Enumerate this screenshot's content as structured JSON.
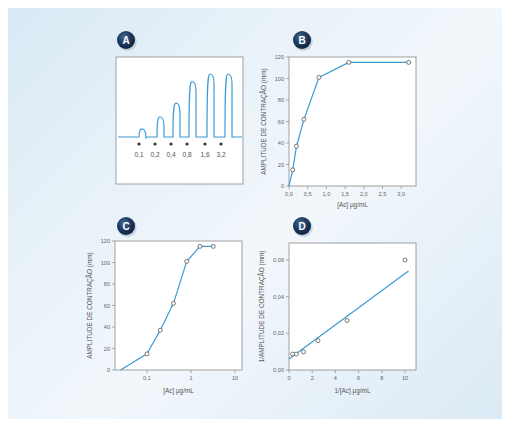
{
  "colors": {
    "line": "#3d9ad6",
    "frame": "#8a8a8a",
    "badge": "#1e3a60",
    "background": "#e3eff7"
  },
  "panels": {
    "A": {
      "badge": "A",
      "doses": [
        "0,1",
        "0,2",
        "0,4",
        "0,8",
        "1,6",
        "3,2"
      ]
    },
    "B": {
      "badge": "B",
      "xlabel": "[Ac] µg/mL",
      "ylabel": "AMPLITUDE DE CONTRAÇÃO (mm)",
      "xticks": [
        "0,0",
        "0,5",
        "1,0",
        "1,5",
        "2,0",
        "2,5",
        "3,0"
      ],
      "yticks": [
        "0",
        "20",
        "40",
        "60",
        "80",
        "100",
        "120"
      ]
    },
    "C": {
      "badge": "C",
      "xlabel": "[Ac] µg/mL",
      "ylabel": "AMPLITUDE DE CONTRAÇÃO (mm)",
      "xticks": [
        "0,1",
        "1",
        "10"
      ],
      "yticks": [
        "0",
        "20",
        "40",
        "60",
        "80",
        "100",
        "120"
      ]
    },
    "D": {
      "badge": "D",
      "xlabel": "1/[Ac] µg/mL",
      "ylabel": "1/AMPLITUDE DE CONTRAÇÃO (mm)",
      "xticks": [
        "0",
        "2",
        "4",
        "6",
        "8",
        "10"
      ],
      "yticks": [
        "0,00",
        "0,02",
        "0,04",
        "0,06"
      ]
    }
  },
  "chart_data": [
    {
      "panel": "A",
      "type": "line",
      "title": "Contraction trace",
      "categories": [
        "0,1",
        "0,2",
        "0,4",
        "0,8",
        "1,6",
        "3,2"
      ],
      "values": [
        15,
        37,
        62,
        101,
        115,
        115
      ],
      "xlabel": "",
      "ylabel": ""
    },
    {
      "panel": "B",
      "type": "line",
      "x": [
        0,
        0.1,
        0.2,
        0.4,
        0.8,
        1.6,
        3.2
      ],
      "values": [
        0,
        15,
        37,
        62,
        101,
        115,
        115
      ],
      "xlabel": "[Ac] µg/mL",
      "ylabel": "AMPLITUDE DE CONTRAÇÃO (mm)",
      "xlim": [
        0,
        3.4
      ],
      "ylim": [
        0,
        120
      ],
      "grid": false
    },
    {
      "panel": "C",
      "type": "line",
      "xscale": "log",
      "x": [
        0.025,
        0.1,
        0.2,
        0.4,
        0.8,
        1.6,
        3.2
      ],
      "values": [
        0,
        15,
        37,
        62,
        101,
        115,
        115
      ],
      "xlabel": "[Ac] µg/mL",
      "ylabel": "AMPLITUDE DE CONTRAÇÃO (mm)",
      "xlim": [
        0.025,
        16
      ],
      "ylim": [
        0,
        120
      ],
      "grid": false
    },
    {
      "panel": "D",
      "type": "scatter",
      "x": [
        0.31,
        0.625,
        1.25,
        2.5,
        5,
        10
      ],
      "values": [
        0.0087,
        0.0087,
        0.0099,
        0.016,
        0.027,
        0.06
      ],
      "fit_line": {
        "x": [
          0,
          10.3
        ],
        "y": [
          0.006,
          0.054
        ]
      },
      "xlabel": "1/[Ac] µg/mL",
      "ylabel": "1/AMPLITUDE DE CONTRAÇÃO (mm)",
      "xlim": [
        0,
        11
      ],
      "ylim": [
        0,
        0.07
      ],
      "grid": false
    }
  ]
}
